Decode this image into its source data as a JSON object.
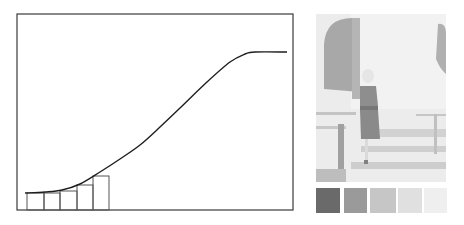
{
  "chart_data": {
    "type": "line",
    "title": "",
    "xlabel": "",
    "ylabel": "",
    "grid": false,
    "legend": null,
    "frame": {
      "left": 17,
      "top": 14,
      "right": 293,
      "bottom": 210
    },
    "series": [
      {
        "name": "tone curve",
        "kind": "line",
        "points_px": [
          [
            25,
            193
          ],
          [
            45,
            192
          ],
          [
            62,
            190
          ],
          [
            80,
            184
          ],
          [
            100,
            172
          ],
          [
            120,
            159
          ],
          [
            140,
            145
          ],
          [
            160,
            127
          ],
          [
            180,
            108
          ],
          [
            207,
            82
          ],
          [
            230,
            62
          ],
          [
            245,
            54
          ],
          [
            255,
            52
          ],
          [
            287,
            52
          ]
        ]
      },
      {
        "name": "step bars",
        "kind": "bar",
        "bars_px": [
          {
            "x0": 27,
            "x1": 44,
            "top": 193
          },
          {
            "x0": 44,
            "x1": 60,
            "top": 193
          },
          {
            "x0": 60,
            "x1": 77,
            "top": 191
          },
          {
            "x0": 77,
            "x1": 93,
            "top": 185
          },
          {
            "x0": 93,
            "x1": 109,
            "top": 176
          }
        ]
      }
    ]
  },
  "photo": {
    "description": "grayscale photograph of a woman standing on steps beside an arched doorway"
  },
  "swatches": [
    {
      "x": 0,
      "w": 24,
      "color": "#6a6a6a"
    },
    {
      "x": 28,
      "w": 23,
      "color": "#9a9a9a"
    },
    {
      "x": 54,
      "w": 26,
      "color": "#c6c6c6"
    },
    {
      "x": 82,
      "w": 24,
      "color": "#e0e0e0"
    },
    {
      "x": 108,
      "w": 23,
      "color": "#efefef"
    }
  ],
  "colors": {
    "ink": "#1e1e1e",
    "frame": "#3a3a3a",
    "bar_stroke": "#555555"
  }
}
